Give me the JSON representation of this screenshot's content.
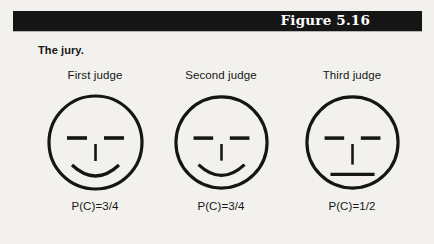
{
  "figure": {
    "title": "Figure 5.16",
    "caption": "The jury.",
    "background_color": "#f2f1ee",
    "ink_color": "#151515",
    "title_bar_color": "#151515",
    "title_text_color": "#ffffff"
  },
  "judges": [
    {
      "label": "First judge",
      "probability": "P(C)=3/4",
      "expression": "smiling",
      "mouth": "smile-curve",
      "eyes": "two-horizontal-dashes",
      "nose": "vertical-line"
    },
    {
      "label": "Second judge",
      "probability": "P(C)=3/4",
      "expression": "smiling",
      "mouth": "smile-curve",
      "eyes": "two-horizontal-dashes",
      "nose": "vertical-line"
    },
    {
      "label": "Third judge",
      "probability": "P(C)=1/2",
      "expression": "neutral",
      "mouth": "straight-line",
      "eyes": "two-horizontal-dashes",
      "nose": "vertical-line"
    }
  ]
}
